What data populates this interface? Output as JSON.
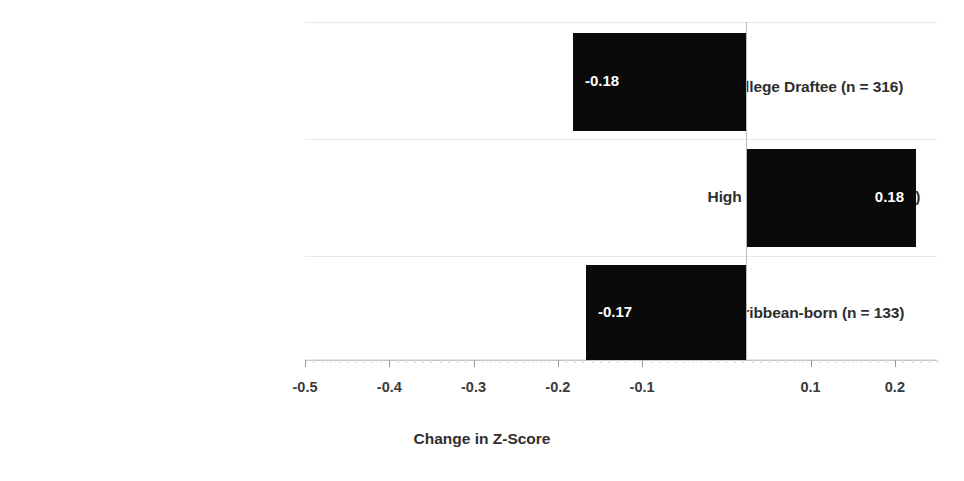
{
  "chart_data": {
    "type": "bar",
    "orientation": "horizontal",
    "title": "",
    "subtitle": "",
    "xlabel": "Change in Z-Score",
    "ylabel": "",
    "categories": [
      "College Draftee (n = 316)",
      "High School Draftee (n = 179)",
      "Caribbean-born (n = 133)"
    ],
    "values": [
      -0.18,
      0.18,
      -0.17
    ],
    "data_labels": [
      "-0.18",
      "0.18",
      "-0.17"
    ],
    "xlim": [
      -0.5,
      0.25
    ],
    "xticks": [
      -0.5,
      -0.4,
      -0.3,
      -0.2,
      -0.1,
      0.1,
      0.2
    ],
    "xtick_labels": [
      "-0.5",
      "-0.4",
      "-0.3",
      "-0.2",
      "-0.1",
      "0.1",
      "0.2"
    ],
    "bar_color": "#0a0a0a",
    "data_label_color": "#ffffff",
    "grid": {
      "horizontal": true,
      "vertical": false,
      "color": "#e9e9e9"
    },
    "zero_line": {
      "value": 0,
      "color": "#b9b9b9"
    },
    "legend": {
      "visible": false,
      "position": "none",
      "entries": []
    }
  }
}
